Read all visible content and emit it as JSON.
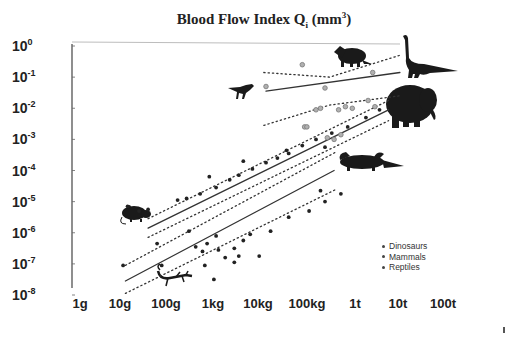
{
  "chart_data": {
    "type": "scatter",
    "title_parts": {
      "main": "Blood Flow Index Q",
      "subscript": "i",
      "unit_open": " (mm",
      "unit_exp": "3",
      "unit_close": ")"
    },
    "xlabel": "Body mass",
    "ylabel": "Blood Flow Index Q_i (mm^3)",
    "x_scale": "log",
    "y_scale": "log",
    "x_ticks": [
      "1g",
      "10g",
      "100g",
      "1kg",
      "10kg",
      "100kg",
      "1t",
      "10t",
      "100t"
    ],
    "x_tick_values_kg": [
      0.001,
      0.01,
      0.1,
      1,
      10,
      100,
      1000,
      10000,
      100000
    ],
    "y_ticks": [
      {
        "base": "10",
        "exp": "0"
      },
      {
        "base": "10",
        "exp": "-1"
      },
      {
        "base": "10",
        "exp": "-2"
      },
      {
        "base": "10",
        "exp": "-3"
      },
      {
        "base": "10",
        "exp": "-4"
      },
      {
        "base": "10",
        "exp": "-5"
      },
      {
        "base": "10",
        "exp": "-6"
      },
      {
        "base": "10",
        "exp": "-7"
      },
      {
        "base": "10",
        "exp": "-8"
      }
    ],
    "y_tick_values": [
      1,
      0.1,
      0.01,
      0.001,
      0.0001,
      1e-05,
      1e-06,
      1e-07,
      1e-08
    ],
    "xlim_log10_kg": [
      -3,
      5
    ],
    "ylim_log10": [
      -8,
      0
    ],
    "grid": false,
    "legend_position": "lower right",
    "legend": [
      "Dinosaurs",
      "Mammals",
      "Reptiles"
    ],
    "series": [
      {
        "name": "Dinosaurs",
        "marker": "open grey circle",
        "color": "#8a8a8a",
        "points_log10": [
          {
            "x": 1.1,
            "y": -1.3
          },
          {
            "x": 1.9,
            "y": -0.6
          },
          {
            "x": 2.4,
            "y": -1.35
          },
          {
            "x": 3.5,
            "y": -1.95
          },
          {
            "x": 3.45,
            "y": -0.85
          },
          {
            "x": 2.2,
            "y": -2.05
          },
          {
            "x": 2.3,
            "y": -2.0
          },
          {
            "x": 2.7,
            "y": -2.05
          },
          {
            "x": 2.85,
            "y": -1.95
          },
          {
            "x": 3.0,
            "y": -2.0
          },
          {
            "x": 1.95,
            "y": -2.6
          },
          {
            "x": 2.0,
            "y": -2.6
          },
          {
            "x": 2.45,
            "y": -2.95
          },
          {
            "x": 2.6,
            "y": -3.0
          },
          {
            "x": 2.75,
            "y": -2.85
          },
          {
            "x": 3.35,
            "y": -1.75
          }
        ],
        "fit_line_log10": [
          [
            1.1,
            -1.45
          ],
          [
            4.05,
            -0.85
          ]
        ],
        "ci_upper_log10": [
          [
            1.05,
            -0.85
          ],
          [
            2.5,
            -1.0
          ],
          [
            4.05,
            -0.3
          ]
        ],
        "ci_lower_log10": [
          [
            1.05,
            -2.55
          ],
          [
            2.5,
            -1.9
          ],
          [
            4.05,
            -1.6
          ]
        ]
      },
      {
        "name": "Mammals",
        "marker": "small black dot",
        "color": "#222222",
        "points_log10": [
          {
            "x": -1.95,
            "y": -5.15
          },
          {
            "x": -1.7,
            "y": -5.3
          },
          {
            "x": -1.5,
            "y": -5.25
          },
          {
            "x": -0.85,
            "y": -4.95
          },
          {
            "x": -0.65,
            "y": -4.9
          },
          {
            "x": -0.35,
            "y": -4.75
          },
          {
            "x": 0.0,
            "y": -4.55
          },
          {
            "x": 0.3,
            "y": -4.3
          },
          {
            "x": 0.5,
            "y": -4.15
          },
          {
            "x": 0.8,
            "y": -3.95
          },
          {
            "x": 1.1,
            "y": -3.75
          },
          {
            "x": 1.35,
            "y": -3.6
          },
          {
            "x": 1.6,
            "y": -3.45
          },
          {
            "x": 1.9,
            "y": -3.2
          },
          {
            "x": 2.2,
            "y": -3.0
          },
          {
            "x": 2.55,
            "y": -2.8
          },
          {
            "x": 2.9,
            "y": -2.6
          },
          {
            "x": 3.3,
            "y": -2.3
          },
          {
            "x": 3.6,
            "y": -2.05
          },
          {
            "x": -0.15,
            "y": -4.2
          },
          {
            "x": 0.6,
            "y": -3.7
          },
          {
            "x": 1.55,
            "y": -3.35
          },
          {
            "x": 2.4,
            "y": -3.25
          }
        ],
        "fit_line_log10": [
          [
            -1.5,
            -5.85
          ],
          [
            3.8,
            -2.05
          ]
        ],
        "ci_upper_log10": [
          [
            -1.5,
            -5.55
          ],
          [
            3.8,
            -1.75
          ]
        ],
        "ci_lower_log10": [
          [
            -1.5,
            -6.15
          ],
          [
            3.8,
            -2.4
          ]
        ]
      },
      {
        "name": "Reptiles",
        "marker": "small black dot",
        "color": "#222222",
        "points_log10": [
          {
            "x": -2.05,
            "y": -7.05
          },
          {
            "x": -1.2,
            "y": -7.05
          },
          {
            "x": -1.3,
            "y": -6.35
          },
          {
            "x": -0.6,
            "y": -5.95
          },
          {
            "x": -0.45,
            "y": -6.45
          },
          {
            "x": -0.3,
            "y": -6.6
          },
          {
            "x": -0.2,
            "y": -6.35
          },
          {
            "x": 0.0,
            "y": -6.1
          },
          {
            "x": 0.05,
            "y": -6.55
          },
          {
            "x": 0.2,
            "y": -6.8
          },
          {
            "x": 0.4,
            "y": -6.5
          },
          {
            "x": 0.5,
            "y": -6.75
          },
          {
            "x": 0.6,
            "y": -6.25
          },
          {
            "x": 0.75,
            "y": -6.05
          },
          {
            "x": -0.25,
            "y": -7.05
          },
          {
            "x": 0.4,
            "y": -6.95
          },
          {
            "x": 1.2,
            "y": -5.95
          },
          {
            "x": 1.6,
            "y": -5.5
          },
          {
            "x": 2.05,
            "y": -5.3
          },
          {
            "x": 2.4,
            "y": -5.0
          },
          {
            "x": 0.95,
            "y": -6.75
          },
          {
            "x": 2.75,
            "y": -4.75
          },
          {
            "x": -0.05,
            "y": -7.5
          },
          {
            "x": 2.3,
            "y": -4.65
          }
        ],
        "fit_line_log10": [
          [
            -2.0,
            -7.55
          ],
          [
            2.6,
            -4.0
          ]
        ],
        "ci_upper_log10": [
          [
            -2.0,
            -7.05
          ],
          [
            2.65,
            -3.4
          ]
        ],
        "ci_lower_log10": [
          [
            -2.0,
            -7.95
          ],
          [
            2.65,
            -4.6
          ]
        ]
      }
    ],
    "annotations": [
      {
        "type": "silhouette",
        "label": "shrew/rat",
        "near": "100g, 10^-6"
      },
      {
        "type": "silhouette",
        "label": "lizard",
        "near": "100g-1kg, 10^-7.5"
      },
      {
        "type": "silhouette",
        "label": "theropod dinosaur",
        "near": "10kg, 10^-2"
      },
      {
        "type": "silhouette",
        "label": "triceratops",
        "near": "1t, 10^-0.5"
      },
      {
        "type": "silhouette",
        "label": "sauropod",
        "near": "10t-100t, 10^0"
      },
      {
        "type": "silhouette",
        "label": "elephant",
        "near": "10t, 10^-3"
      },
      {
        "type": "silhouette",
        "label": "crocodile",
        "near": "1t, 10^-4.7"
      }
    ]
  },
  "title": {
    "main": "Blood Flow Index Q",
    "subscript": "i",
    "unit_open": " (mm",
    "unit_exp": "3",
    "unit_close": ")"
  },
  "legend": {
    "items": [
      {
        "label": "Dinosaurs"
      },
      {
        "label": "Mammals"
      },
      {
        "label": "Reptiles"
      }
    ]
  },
  "axes": {
    "y_labels": [
      {
        "base": "10",
        "exp": "0"
      },
      {
        "base": "10",
        "exp": "-1"
      },
      {
        "base": "10",
        "exp": "-2"
      },
      {
        "base": "10",
        "exp": "-3"
      },
      {
        "base": "10",
        "exp": "-4"
      },
      {
        "base": "10",
        "exp": "-5"
      },
      {
        "base": "10",
        "exp": "-6"
      },
      {
        "base": "10",
        "exp": "-7"
      },
      {
        "base": "10",
        "exp": "-8"
      }
    ],
    "x_labels": [
      "1g",
      "10g",
      "100g",
      "1kg",
      "10kg",
      "100kg",
      "1t",
      "10t",
      "100t"
    ]
  },
  "colors": {
    "text": "#222222",
    "axis": "#444444",
    "dino_point": "#8a8a8a",
    "black_point": "#222222",
    "silhouette": "#1a1a1a"
  }
}
